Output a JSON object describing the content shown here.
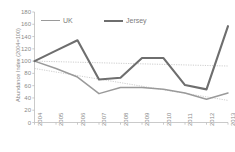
{
  "chart_data": {
    "type": "line",
    "title": "",
    "xlabel": "",
    "ylabel": "Abundance Index (2004=100)",
    "categories": [
      "2004",
      "2005",
      "2006",
      "2007",
      "2008",
      "2009",
      "2010",
      "2011",
      "2012",
      "2013"
    ],
    "ylim": [
      0,
      180
    ],
    "yticks": [
      "0",
      "20",
      "40",
      "60",
      "80",
      "100",
      "120",
      "140",
      "160",
      "180"
    ],
    "grid": false,
    "legend_position": "top",
    "series": [
      {
        "name": "UK",
        "color": "#9a9a9a",
        "values": [
          100,
          88,
          74,
          47,
          57,
          57,
          54,
          48,
          38,
          48
        ]
      },
      {
        "name": "Jersey",
        "color": "#6e6e6e",
        "values": [
          100,
          117,
          134,
          70,
          73,
          105,
          105,
          61,
          54,
          157
        ]
      }
    ],
    "trendlines": [
      {
        "name": "UK trendline",
        "color": "#b9b9b9",
        "start_value": 88,
        "end_value": 36
      },
      {
        "name": "Jersey trendline",
        "color": "#b9b9b9",
        "start_value": 100,
        "end_value": 92
      }
    ]
  },
  "legend": {
    "items": [
      {
        "label": "UK",
        "key": "uk"
      },
      {
        "label": "Jersey",
        "key": "jersey"
      }
    ]
  },
  "axis": {
    "y_title": "Abundance Index (2004=100)"
  }
}
